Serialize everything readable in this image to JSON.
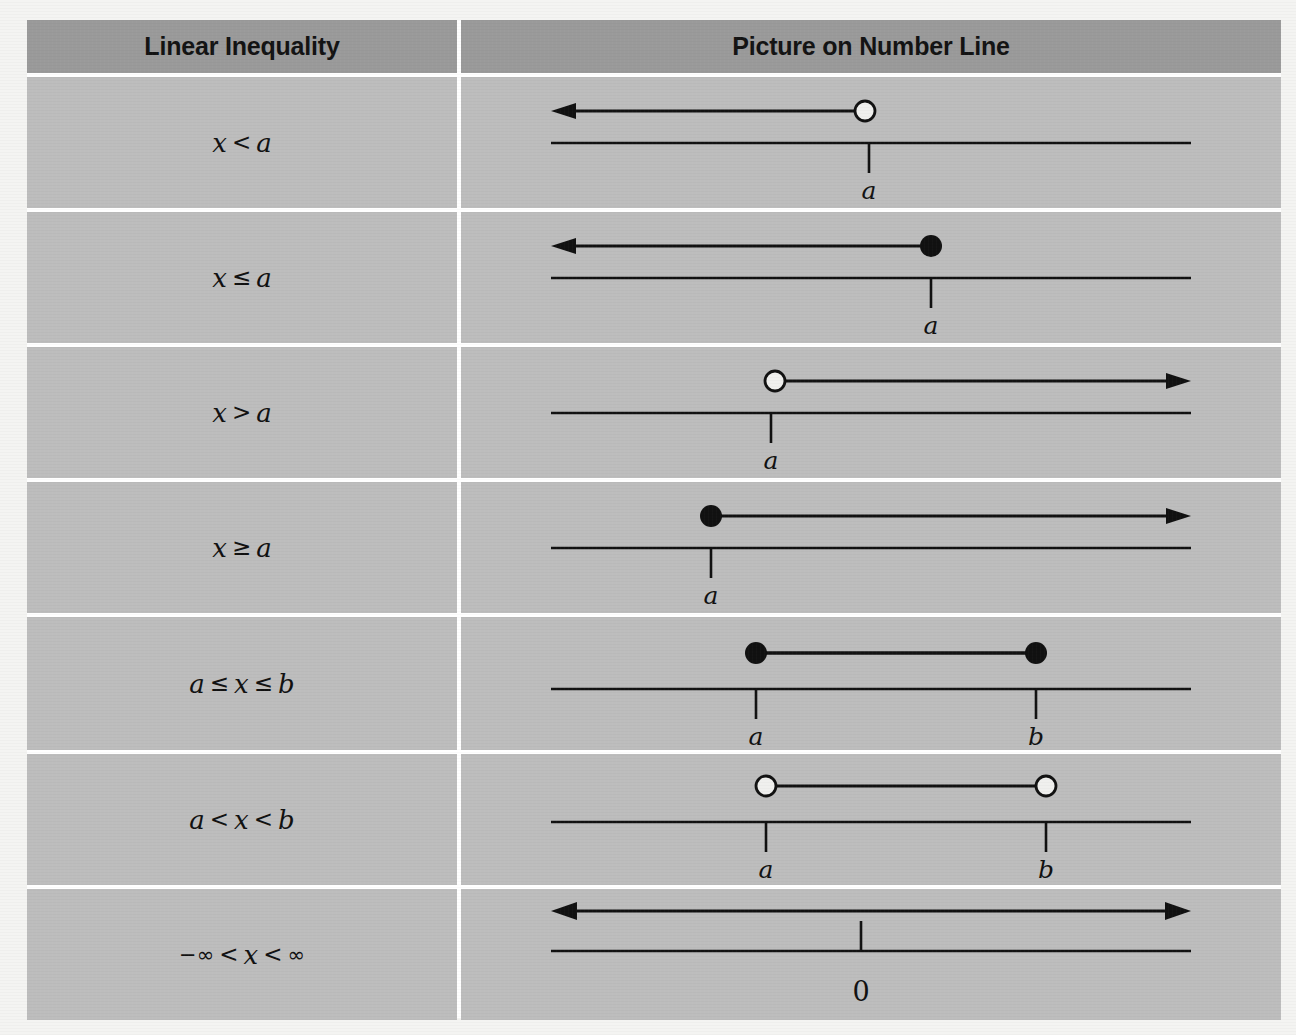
{
  "table": {
    "headers": {
      "left": "Linear Inequality",
      "right": "Picture on Number Line"
    },
    "rows": [
      {
        "inequality_text": "x < a",
        "lhs": "x",
        "operator": "<",
        "rhs": "a",
        "tick_labels": [
          "a"
        ],
        "graphic": "ray-left-open"
      },
      {
        "inequality_text": "x ≤ a",
        "lhs": "x",
        "operator": "≤",
        "rhs": "a",
        "tick_labels": [
          "a"
        ],
        "graphic": "ray-left-closed"
      },
      {
        "inequality_text": "x > a",
        "lhs": "x",
        "operator": ">",
        "rhs": "a",
        "tick_labels": [
          "a"
        ],
        "graphic": "ray-right-open"
      },
      {
        "inequality_text": "x ≥ a",
        "lhs": "x",
        "operator": "≥",
        "rhs": "a",
        "tick_labels": [
          "a"
        ],
        "graphic": "ray-right-closed"
      },
      {
        "inequality_text": "a ≤ x ≤ b",
        "lhs": "a",
        "operator": "≤",
        "mid": "x",
        "operator2": "≤",
        "rhs": "b",
        "tick_labels": [
          "a",
          "b"
        ],
        "graphic": "segment-closed"
      },
      {
        "inequality_text": "a < x < b",
        "lhs": "a",
        "operator": "<",
        "mid": "x",
        "operator2": "<",
        "rhs": "b",
        "tick_labels": [
          "a",
          "b"
        ],
        "graphic": "segment-open"
      },
      {
        "inequality_text": "−∞ < x < ∞",
        "lhs": "−∞",
        "operator": "<",
        "mid": "x",
        "operator2": "<",
        "rhs": "∞",
        "tick_labels": [
          "0"
        ],
        "graphic": "double-arrow"
      }
    ]
  },
  "colors": {
    "page_background": "#f4f4f2",
    "header_fill": "#9a9a9a",
    "cell_fill": "#bdbdbd",
    "gridline": "#ffffff",
    "ink": "#111111",
    "open_dot_fill": "#f0f0ee"
  }
}
